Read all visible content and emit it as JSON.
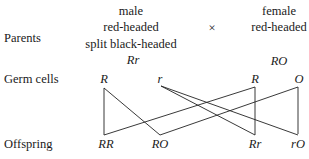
{
  "row_labels": {
    "parents": "Parents",
    "germ_cells": "Germ cells",
    "offspring": "Offspring"
  },
  "male": {
    "line1": "male",
    "line2": "red-headed",
    "line3": "split black-headed",
    "genotype": "Rr"
  },
  "cross_symbol": "×",
  "female": {
    "line1": "female",
    "line2": "red-headed",
    "genotype": "RO"
  },
  "germ_cells": [
    "R",
    "r",
    "R",
    "O"
  ],
  "offspring": [
    "RR",
    "RO",
    "Rr",
    "rO"
  ],
  "connections": [
    {
      "from": "male R",
      "to": "RR"
    },
    {
      "from": "male R",
      "to": "RO"
    },
    {
      "from": "male r",
      "to": "Rr"
    },
    {
      "from": "male r",
      "to": "rO"
    },
    {
      "from": "female R",
      "to": "RR"
    },
    {
      "from": "female R",
      "to": "Rr"
    },
    {
      "from": "female O",
      "to": "RO"
    },
    {
      "from": "female O",
      "to": "rO"
    }
  ]
}
